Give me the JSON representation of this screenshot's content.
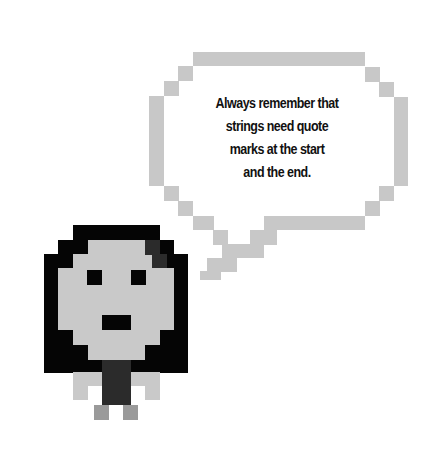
{
  "speech_bubble": {
    "lines": [
      "Always remember that",
      "strings need quote",
      "marks at the start",
      "and the end."
    ]
  },
  "character": {
    "name": "pixel-girl",
    "colors": {
      "hair": "#050505",
      "face": "#c9c9c9",
      "body": "#2b2b2b",
      "feet": "#9a9a9a",
      "bubble_outline": "#c8c8c8"
    }
  }
}
